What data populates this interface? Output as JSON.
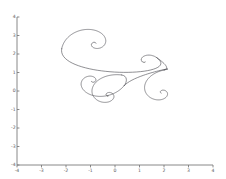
{
  "figure": {
    "background_color": "#ffffff",
    "width": 226,
    "height": 179
  },
  "chart_data": {
    "type": "line",
    "title": "",
    "xlabel": "",
    "ylabel": "",
    "grid": false,
    "legend": null,
    "xlim": [
      -4,
      4
    ],
    "ylim": [
      -4,
      4
    ],
    "xticks": [
      -4,
      -3,
      -2,
      -1,
      0,
      1,
      2,
      3,
      4
    ],
    "yticks": [
      -4,
      -3,
      -2,
      -1,
      0,
      1,
      2,
      3,
      4
    ],
    "xtick_labels": [
      "-4",
      "-3",
      "-2",
      "-1",
      "0",
      "1",
      "2",
      "3",
      "4"
    ],
    "ytick_labels": [
      "-4",
      "-3",
      "-2",
      "-1",
      "0",
      "1",
      "2",
      "3",
      "4"
    ],
    "axes_style": "left-bottom-spines",
    "line_color": "#4a4a52",
    "line_width": 0.62,
    "series": [
      {
        "name": "spiral-curve",
        "description": "continuous chain of logarithmic spirals",
        "spirals": [
          {
            "name": "upper-left-spiral",
            "center_x": -0.82,
            "center_y": 2.55,
            "r_start": 1.38,
            "r_end": 0.055,
            "theta_start": 2.95,
            "theta_end": 11.9,
            "direction": "clockwise-inward"
          },
          {
            "name": "small-right-loop",
            "center_x": 1.22,
            "center_y": 1.62,
            "r_start": 0.52,
            "r_end": 0.05,
            "theta_start": 0.35,
            "theta_end": 5.1,
            "direction": "counterclockwise-inward"
          },
          {
            "name": "right-spiral",
            "center_x": 1.92,
            "center_y": -0.08,
            "r_start": 1.22,
            "r_end": 0.05,
            "theta_start": 1.5,
            "theta_end": 10.2,
            "direction": "counterclockwise-inward"
          },
          {
            "name": "mid-left-spiral",
            "center_x": -0.92,
            "center_y": 0.55,
            "r_start": 1.32,
            "r_end": 0.05,
            "theta_start": 0.2,
            "theta_end": 8.8,
            "direction": "clockwise-inward"
          },
          {
            "name": "lower-center-spiral",
            "center_x": -0.28,
            "center_y": -0.22,
            "r_start": 1.22,
            "r_end": 0.045,
            "theta_start": 1.1,
            "theta_end": 11.2,
            "direction": "counterclockwise-inward"
          }
        ]
      }
    ]
  }
}
